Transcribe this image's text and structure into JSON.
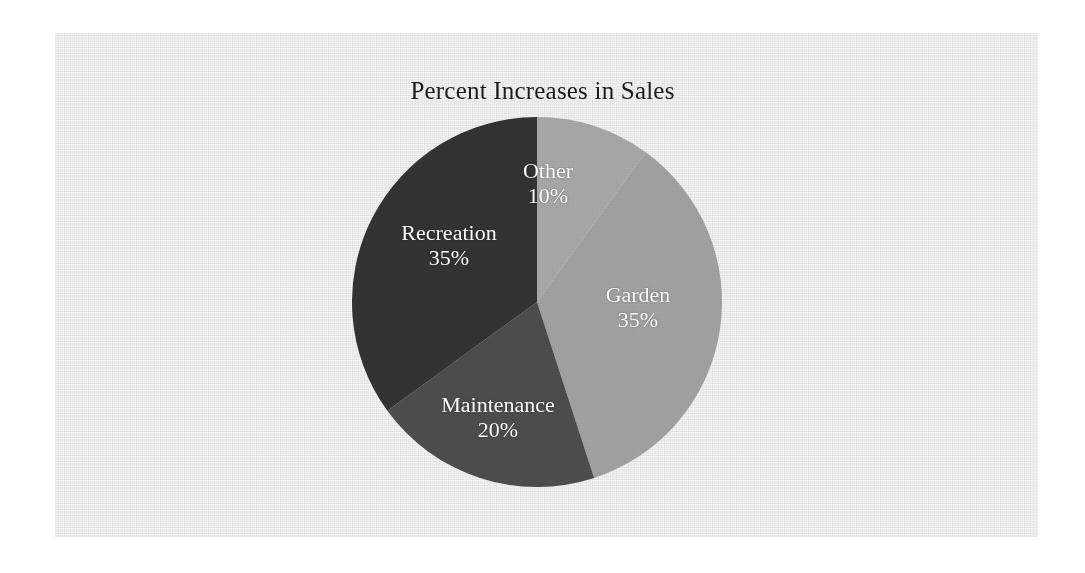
{
  "chart_data": {
    "type": "pie",
    "title": "Percent Increases in Sales",
    "xlabel": "",
    "ylabel": "",
    "legend_position": "none",
    "grid": false,
    "start_angle_deg": 0,
    "direction": "clockwise",
    "categories": [
      "Other",
      "Garden",
      "Maintenance",
      "Recreation"
    ],
    "values": [
      10,
      35,
      20,
      35
    ],
    "value_suffix": "%",
    "slices": [
      {
        "label": "Other",
        "value": 10,
        "value_label": "10%",
        "color": "#a8a8a8",
        "label_color": "#ffffff"
      },
      {
        "label": "Garden",
        "value": 35,
        "value_label": "35%",
        "color": "#a2a2a2",
        "label_color": "#ffffff"
      },
      {
        "label": "Maintenance",
        "value": 20,
        "value_label": "20%",
        "color": "#4d4d4d",
        "label_color": "#ffffff"
      },
      {
        "label": "Recreation",
        "value": 35,
        "value_label": "35%",
        "color": "#333333",
        "label_color": "#ffffff"
      }
    ],
    "total": 100,
    "annotations": []
  },
  "colors": {
    "page_background": "#ffffff",
    "scan_background": "#f3f3f3",
    "title_text": "#1c1c1c",
    "slice_other": "#a8a8a8",
    "slice_garden": "#a2a2a2",
    "slice_maintenance": "#4d4d4d",
    "slice_recreation": "#333333"
  }
}
